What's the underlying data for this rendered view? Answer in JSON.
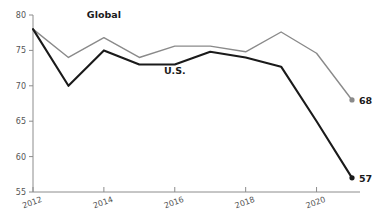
{
  "chart_data": {
    "type": "line",
    "title": "",
    "subtitle": "",
    "xlabel": "",
    "ylabel": "",
    "x": [
      2012,
      2013,
      2014,
      2015,
      2016,
      2017,
      2018,
      2019,
      2020,
      2021
    ],
    "xlim": [
      2012,
      2021
    ],
    "ylim": [
      55,
      80
    ],
    "xticks": [
      2012,
      2014,
      2016,
      2018,
      2020
    ],
    "xtick_labels": [
      "2012",
      "2014",
      "2016",
      "2018",
      "2020"
    ],
    "yticks": [
      55,
      60,
      65,
      70,
      75,
      80
    ],
    "ytick_labels": [
      "55",
      "60",
      "65",
      "70",
      "75",
      "80"
    ],
    "grid": false,
    "legend_position": "inline-annotation",
    "series": [
      {
        "name": "Global",
        "color": "#8a8a8a",
        "label": "Global",
        "label_x": 2014.0,
        "label_y": 79.6,
        "endpoint_label": "68",
        "endpoint_marker": true,
        "values": [
          78.0,
          74.0,
          76.8,
          74.0,
          75.6,
          75.6,
          74.8,
          77.6,
          74.6,
          68.0
        ]
      },
      {
        "name": "U.S.",
        "color": "#1a1a1a",
        "label": "U.S.",
        "label_x": 2016.0,
        "label_y": 71.6,
        "endpoint_label": "57",
        "endpoint_marker": true,
        "values": [
          78.0,
          70.0,
          75.0,
          73.0,
          73.0,
          74.8,
          74.0,
          72.7,
          65.0,
          57.0
        ]
      }
    ]
  }
}
